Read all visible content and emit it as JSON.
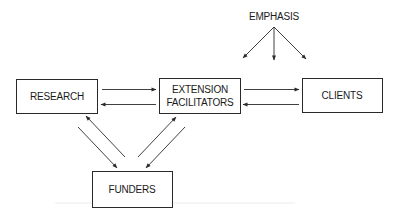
{
  "diagram": {
    "type": "flow",
    "nodes": {
      "emphasis": {
        "label": "EMPHASIS"
      },
      "research": {
        "label": "RESEARCH"
      },
      "extension": {
        "label_line1": "EXTENSION",
        "label_line2": "FACILITATORS"
      },
      "clients": {
        "label": "CLIENTS"
      },
      "funders": {
        "label": "FUNDERS"
      }
    },
    "edges": [
      {
        "from": "EMPHASIS",
        "to": "EXTENSION FACILITATORS (toward)"
      },
      {
        "from": "EMPHASIS",
        "to": "between EXTENSION FACILITATORS and CLIENTS"
      },
      {
        "from": "EMPHASIS",
        "to": "CLIENTS (toward)"
      },
      {
        "from": "RESEARCH",
        "to": "EXTENSION FACILITATORS"
      },
      {
        "from": "EXTENSION FACILITATORS",
        "to": "RESEARCH"
      },
      {
        "from": "EXTENSION FACILITATORS",
        "to": "CLIENTS"
      },
      {
        "from": "CLIENTS",
        "to": "EXTENSION FACILITATORS"
      },
      {
        "from": "RESEARCH",
        "to": "FUNDERS"
      },
      {
        "from": "FUNDERS",
        "to": "RESEARCH"
      },
      {
        "from": "FUNDERS",
        "to": "EXTENSION FACILITATORS"
      },
      {
        "from": "EXTENSION FACILITATORS",
        "to": "FUNDERS"
      }
    ]
  }
}
